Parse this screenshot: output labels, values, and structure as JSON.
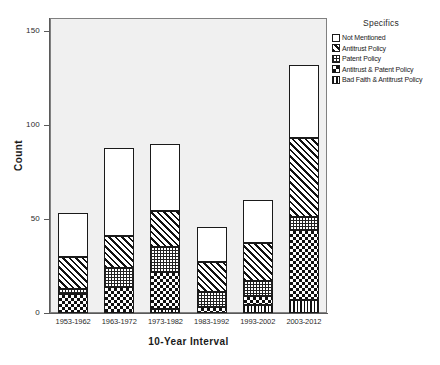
{
  "chart_data": {
    "type": "bar",
    "subtype": "stacked-bar",
    "title": "",
    "xlabel": "10-Year Interval",
    "ylabel": "Count",
    "ylim": [
      0,
      158
    ],
    "yticks": [
      0,
      50,
      100,
      150
    ],
    "ytick_labels": [
      "0",
      "50",
      "100",
      "150"
    ],
    "grid": false,
    "legend_title": "Specifics",
    "legend_position": "right",
    "categories": [
      "1953-1962",
      "1963-1972",
      "1973-1982",
      "1983-1992",
      "1993-2002",
      "2003-2012"
    ],
    "series": [
      {
        "name": "Bad Faith & Antitrust Policy",
        "pattern": "vertical-stripes",
        "values": [
          0,
          0,
          2,
          0,
          4,
          7
        ]
      },
      {
        "name": "Antitrust & Patent Policy",
        "pattern": "checkerboard",
        "values": [
          10,
          14,
          20,
          3,
          5,
          37
        ]
      },
      {
        "name": "Patent Policy",
        "pattern": "fine-dots",
        "values": [
          3,
          10,
          13,
          8,
          8,
          7
        ]
      },
      {
        "name": "Antitrust Policy",
        "pattern": "diagonal-hatch",
        "values": [
          17,
          17,
          19,
          16,
          20,
          42
        ]
      },
      {
        "name": "Not Mentioned",
        "pattern": "solid-white",
        "values": [
          23,
          47,
          36,
          19,
          23,
          39
        ]
      }
    ],
    "totals": [
      53,
      88,
      90,
      46,
      60,
      132
    ],
    "colors": {
      "plot_background": "#f0f0f0",
      "page_background": "#ffffff",
      "axis": "#5a5a5a",
      "bar_outline": "#1a1a1a",
      "text": "#1a1a1a"
    }
  },
  "axes": {
    "y_title": "Count",
    "x_title": "10-Year Interval"
  },
  "legend": {
    "title": "Specifics",
    "items": [
      {
        "label": "Not Mentioned",
        "pattern": "solid-white"
      },
      {
        "label": "Antitrust Policy",
        "pattern": "diagonal-hatch"
      },
      {
        "label": "Patent Policy",
        "pattern": "fine-dots"
      },
      {
        "label": "Antitrust & Patent Policy",
        "pattern": "checkerboard"
      },
      {
        "label": "Bad Faith & Antitrust Policy",
        "pattern": "vertical-stripes"
      }
    ]
  }
}
